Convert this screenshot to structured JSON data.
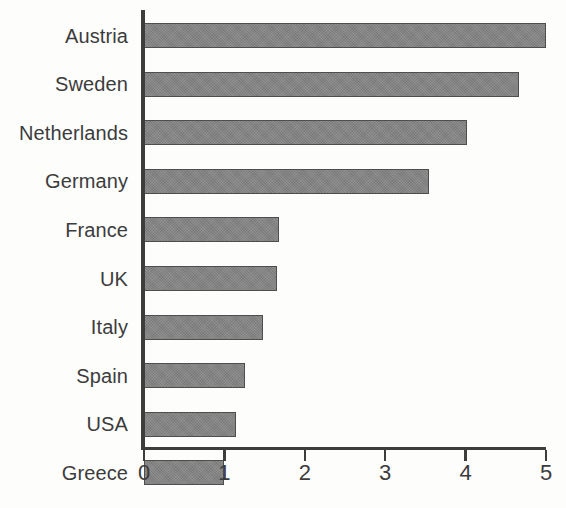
{
  "chart_data": {
    "type": "bar",
    "orientation": "horizontal",
    "title": "",
    "subtitle": "",
    "xlabel": "",
    "ylabel": "",
    "categories": [
      "Austria",
      "Sweden",
      "Netherlands",
      "Germany",
      "France",
      "UK",
      "Italy",
      "Spain",
      "USA",
      "Greece"
    ],
    "values": [
      5.0,
      4.67,
      4.02,
      3.55,
      1.68,
      1.65,
      1.48,
      1.26,
      1.15,
      1.0
    ],
    "xlim": [
      0,
      5
    ],
    "xticks": [
      0,
      1,
      2,
      3,
      4,
      5
    ],
    "xtick_labels": [
      "0",
      "1",
      "2",
      "3",
      "4",
      "5"
    ],
    "grid": false,
    "legend": false,
    "legend_position": "none",
    "annotations": [],
    "colors": {
      "bar_fill": "#848484",
      "bar_border": "#4e4e4e",
      "axis": "#3d3d3d",
      "text": "#3c3c3c",
      "background": "#fdfdfc"
    }
  }
}
